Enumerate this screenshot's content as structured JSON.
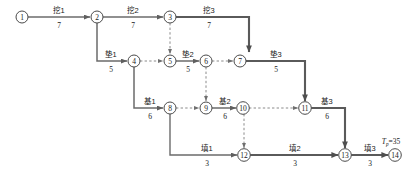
{
  "diagram": {
    "type": "double-code-network-schedule",
    "project_label": "T",
    "project_label_sub": "p",
    "project_label_value": "=35",
    "project_duration": 35,
    "colors": {
      "solid_arrow": "#6b6b6b",
      "dashed_arrow": "#8a8a8a",
      "critical_arrow": "#5a5a5a",
      "node_stroke": "#4a4a4a",
      "text": "#1a1a1a",
      "background": "#ffffff"
    },
    "nodes": [
      {
        "id": "1",
        "label": "1",
        "x": 22,
        "y": 17
      },
      {
        "id": "2",
        "label": "2",
        "x": 97,
        "y": 17
      },
      {
        "id": "3",
        "label": "3",
        "x": 170,
        "y": 17
      },
      {
        "id": "4",
        "label": "4",
        "x": 134,
        "y": 61
      },
      {
        "id": "5",
        "label": "5",
        "x": 170,
        "y": 61
      },
      {
        "id": "6",
        "label": "6",
        "x": 206,
        "y": 61
      },
      {
        "id": "7",
        "label": "7",
        "x": 240,
        "y": 61
      },
      {
        "id": "8",
        "label": "8",
        "x": 170,
        "y": 108
      },
      {
        "id": "9",
        "label": "9",
        "x": 206,
        "y": 108
      },
      {
        "id": "10",
        "label": "10",
        "x": 243,
        "y": 108
      },
      {
        "id": "11",
        "label": "11",
        "x": 305,
        "y": 108
      },
      {
        "id": "12",
        "label": "12",
        "x": 244,
        "y": 155
      },
      {
        "id": "13",
        "label": "13",
        "x": 345,
        "y": 155
      },
      {
        "id": "14",
        "label": "14",
        "x": 395,
        "y": 155
      }
    ],
    "activities": [
      {
        "name": "挖1",
        "duration": "7",
        "from": "1",
        "to": "2",
        "label_x": 59,
        "label_y": 13,
        "dur_x": 59,
        "dur_y": 28
      },
      {
        "name": "挖2",
        "duration": "7",
        "from": "2",
        "to": "3",
        "label_x": 133,
        "label_y": 13,
        "dur_x": 133,
        "dur_y": 28
      },
      {
        "name": "挖3",
        "duration": "7",
        "from": "3",
        "to": "7",
        "label_x": 209,
        "label_y": 13,
        "dur_x": 209,
        "dur_y": 28
      },
      {
        "name": "垫1",
        "duration": "5",
        "from": "2",
        "to": "4",
        "label_x": 111,
        "label_y": 57,
        "dur_x": 111,
        "dur_y": 72
      },
      {
        "name": "垫2",
        "duration": "5",
        "from": "5",
        "to": "6",
        "label_x": 188,
        "label_y": 57,
        "dur_x": 188,
        "dur_y": 72
      },
      {
        "name": "垫3",
        "duration": "5",
        "from": "7",
        "to": "11",
        "label_x": 276,
        "label_y": 57,
        "dur_x": 276,
        "dur_y": 72
      },
      {
        "name": "基1",
        "duration": "6",
        "from": "4",
        "to": "8",
        "label_x": 150,
        "label_y": 104,
        "dur_x": 150,
        "dur_y": 119
      },
      {
        "name": "基2",
        "duration": "6",
        "from": "9",
        "to": "10",
        "label_x": 225,
        "label_y": 104,
        "dur_x": 225,
        "dur_y": 119
      },
      {
        "name": "基3",
        "duration": "6",
        "from": "11",
        "to": "13",
        "label_x": 327,
        "label_y": 104,
        "dur_x": 327,
        "dur_y": 119
      },
      {
        "name": "填1",
        "duration": "3",
        "from": "8",
        "to": "12",
        "label_x": 207,
        "label_y": 151,
        "dur_x": 207,
        "dur_y": 166
      },
      {
        "name": "填2",
        "duration": "3",
        "from": "12",
        "to": "13",
        "label_x": 295,
        "label_y": 151,
        "dur_x": 295,
        "dur_y": 166
      },
      {
        "name": "填3",
        "duration": "3",
        "from": "13",
        "to": "14",
        "label_x": 370,
        "label_y": 151,
        "dur_x": 370,
        "dur_y": 166
      }
    ],
    "dummy_activities": [
      {
        "from": "3",
        "to": "5",
        "kind": "vertical-dashed"
      },
      {
        "from": "4",
        "to": "5",
        "kind": "horizontal-dashed"
      },
      {
        "from": "6",
        "to": "7",
        "kind": "horizontal-dashed"
      },
      {
        "from": "6",
        "to": "9",
        "kind": "vertical-dashed"
      },
      {
        "from": "8",
        "to": "9",
        "kind": "horizontal-dashed"
      },
      {
        "from": "10",
        "to": "11",
        "kind": "horizontal-dashed"
      },
      {
        "from": "10",
        "to": "12",
        "kind": "vertical-dashed"
      }
    ]
  }
}
